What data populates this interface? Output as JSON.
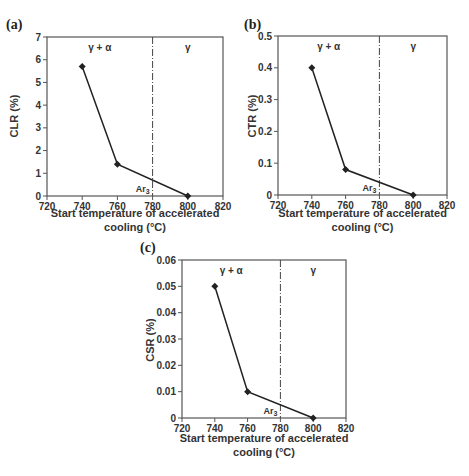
{
  "figure": {
    "panels": [
      {
        "label": "(a)",
        "ylabel": "CLR (%)"
      },
      {
        "label": "(b)",
        "ylabel": "CTR (%)"
      },
      {
        "label": "(c)",
        "ylabel": "CSR (%)"
      }
    ],
    "xlabel_line1": "Start temperature of accelerated",
    "xlabel_line2": "cooling (°C)",
    "region_left": "γ + α",
    "region_right": "γ",
    "transition_label": "Ar",
    "transition_sub": "3",
    "line_color": "#222222"
  },
  "chart_data": [
    {
      "type": "line",
      "panel": "(a)",
      "title": "",
      "xlabel": "Start temperature of accelerated cooling (°C)",
      "ylabel": "CLR (%)",
      "x": [
        740,
        760,
        800
      ],
      "series": [
        {
          "name": "CLR",
          "values": [
            5.7,
            1.4,
            0
          ]
        }
      ],
      "xlim": [
        720,
        820
      ],
      "ylim": [
        0,
        7
      ],
      "xticks": [
        720,
        740,
        760,
        780,
        800,
        820
      ],
      "yticks": [
        0,
        1,
        2,
        3,
        4,
        5,
        6,
        7
      ],
      "vline": {
        "x": 780,
        "label": "Ar3",
        "style": "dash-dot"
      },
      "annotations": [
        {
          "text": "γ + α",
          "x": 750
        },
        {
          "text": "γ",
          "x": 800
        }
      ],
      "grid": false,
      "legend": "none"
    },
    {
      "type": "line",
      "panel": "(b)",
      "title": "",
      "xlabel": "Start temperature of accelerated cooling (°C)",
      "ylabel": "CTR (%)",
      "x": [
        740,
        760,
        800
      ],
      "series": [
        {
          "name": "CTR",
          "values": [
            0.4,
            0.08,
            0
          ]
        }
      ],
      "xlim": [
        720,
        820
      ],
      "ylim": [
        0,
        0.5
      ],
      "xticks": [
        720,
        740,
        760,
        780,
        800,
        820
      ],
      "yticks": [
        0,
        0.1,
        0.2,
        0.3,
        0.4,
        0.5
      ],
      "vline": {
        "x": 780,
        "label": "Ar3",
        "style": "dash-dot"
      },
      "annotations": [
        {
          "text": "γ + α",
          "x": 750
        },
        {
          "text": "γ",
          "x": 800
        }
      ],
      "grid": false,
      "legend": "none"
    },
    {
      "type": "line",
      "panel": "(c)",
      "title": "",
      "xlabel": "Start temperature of accelerated cooling (°C)",
      "ylabel": "CSR (%)",
      "x": [
        740,
        760,
        800
      ],
      "series": [
        {
          "name": "CSR",
          "values": [
            0.05,
            0.01,
            0
          ]
        }
      ],
      "xlim": [
        720,
        820
      ],
      "ylim": [
        0,
        0.06
      ],
      "xticks": [
        720,
        740,
        760,
        780,
        800,
        820
      ],
      "yticks": [
        0,
        0.01,
        0.02,
        0.03,
        0.04,
        0.05,
        0.06
      ],
      "vline": {
        "x": 780,
        "label": "Ar3",
        "style": "dash-dot"
      },
      "annotations": [
        {
          "text": "γ + α",
          "x": 750
        },
        {
          "text": "γ",
          "x": 800
        }
      ],
      "grid": false,
      "legend": "none"
    }
  ]
}
